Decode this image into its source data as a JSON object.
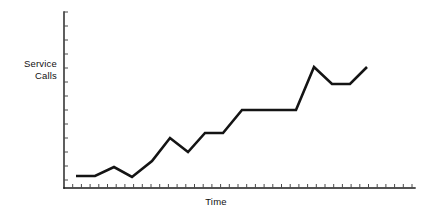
{
  "chart_data": {
    "type": "line",
    "title": "",
    "subtitle": "",
    "xlabel": "Time",
    "ylabel_line1": "Service",
    "ylabel_line2": "Calls",
    "ylabel": "Service Calls",
    "grid": false,
    "legend": false,
    "legend_position": "none",
    "axis_tick_labels_x": [],
    "axis_tick_labels_y": [],
    "xlim": [
      0,
      40
    ],
    "ylim": [
      0,
      20
    ],
    "annotations": [],
    "series": [
      {
        "name": "Service Calls",
        "color": "#141414",
        "x": [
          1.4,
          3.6,
          5.8,
          7.8,
          9.8,
          12.2,
          14.3,
          16.3,
          18.5,
          20.6,
          22.6,
          26.7,
          28.7,
          30.9,
          33.0,
          35.0,
          37.2,
          39.4
        ],
        "y": [
          2.4,
          2.4,
          3.5,
          2.2,
          5.3,
          7.9,
          6.3,
          8.6,
          8.6,
          11.2,
          11.2,
          11.2,
          16.2,
          18.9,
          16.9,
          16.9,
          16.9,
          18.9
        ],
        "values": [
          2.4,
          2.4,
          3.5,
          2.2,
          5.3,
          7.9,
          6.3,
          8.6,
          8.6,
          11.2,
          11.2,
          11.2,
          16.2,
          18.9,
          16.9,
          16.9,
          16.9,
          18.9
        ]
      }
    ],
    "pixel_polyline": "76,176 95,176 114,167 132,177 152,161 170,138 188,152 205,133 223,133 242,110 296,110 314,67 332,84 350,84 367,67",
    "axes": {
      "y_axis_pixels": {
        "x": 64,
        "y_top": 12,
        "y_bottom": 188
      },
      "x_axis_pixels": {
        "y": 188,
        "x_left": 64,
        "x_right": 415
      },
      "x_tick_spacing_px": 8.7,
      "y_tick_spacing_px": 14.0,
      "x_tick_count": 40,
      "y_tick_count": 12,
      "axis_color": "#1a1a1a",
      "tick_color": "#4a4a4a"
    },
    "background_color": "#ffffff",
    "line_color": "#141414"
  }
}
